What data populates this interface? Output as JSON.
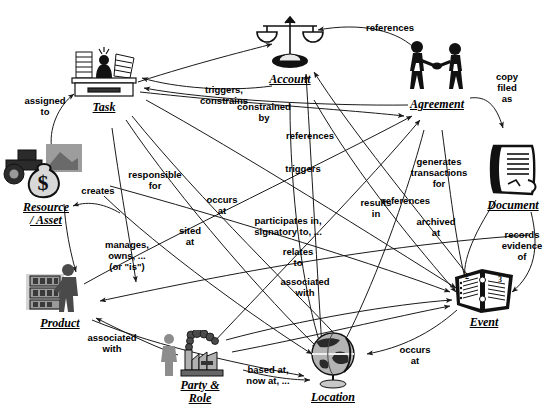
{
  "diagram": {
    "background_color": "#ffffff",
    "line_color": "#1a1a1a",
    "text_color": "#000000",
    "nodes": [
      {
        "id": "task",
        "label": "Task",
        "icon": "desk-paperwork-icon",
        "x": 104,
        "y": 75,
        "w": 76,
        "h": 52,
        "cap_x": 104,
        "cap_y": 113
      },
      {
        "id": "account",
        "label": "Account",
        "icon": "balance-scales-icon",
        "x": 290,
        "y": 45,
        "w": 74,
        "h": 56,
        "cap_x": 290,
        "cap_y": 81
      },
      {
        "id": "agreement",
        "label": "Agreement",
        "icon": "handshake-figures-icon",
        "x": 437,
        "y": 68,
        "w": 74,
        "h": 56,
        "cap_x": 437,
        "cap_y": 122
      },
      {
        "id": "document",
        "label": "Document",
        "icon": "document-sheet-icon",
        "x": 513,
        "y": 170,
        "w": 62,
        "h": 58,
        "cap_x": 513,
        "cap_y": 202
      },
      {
        "id": "event",
        "label": "Event",
        "icon": "open-ledger-book-icon",
        "x": 484,
        "y": 290,
        "w": 66,
        "h": 52,
        "cap_x": 484,
        "cap_y": 325
      },
      {
        "id": "location",
        "label": "Location",
        "icon": "globe-stand-icon",
        "x": 333,
        "y": 360,
        "w": 62,
        "h": 62,
        "cap_x": 333,
        "cap_y": 401
      },
      {
        "id": "party",
        "label": "Party &\nRole",
        "icon": "person-factory-icon",
        "x": 200,
        "y": 355,
        "w": 90,
        "h": 48,
        "cap_x": 200,
        "cap_y": 385
      },
      {
        "id": "product",
        "label": "Product",
        "icon": "person-shelf-display-icon",
        "x": 60,
        "y": 288,
        "w": 72,
        "h": 56,
        "cap_x": 60,
        "cap_y": 323
      },
      {
        "id": "resource",
        "label": "Resource\n/ Asset",
        "icon": "tractor-moneybag-icon",
        "x": 46,
        "y": 172,
        "w": 92,
        "h": 58,
        "cap_x": 46,
        "cap_y": 212
      }
    ],
    "edge_labels": [
      {
        "id": "assigned-to",
        "text": "assigned\nto",
        "x": 45,
        "y": 106
      },
      {
        "id": "creates",
        "text": "creates",
        "x": 98,
        "y": 190
      },
      {
        "id": "triggers-constrains",
        "text": "triggers,\nconstrains",
        "x": 224,
        "y": 95
      },
      {
        "id": "constrained-by",
        "text": "constrained\nby",
        "x": 264,
        "y": 112
      },
      {
        "id": "references-account",
        "text": "references",
        "x": 390,
        "y": 27
      },
      {
        "id": "references-mid",
        "text": "references",
        "x": 310,
        "y": 135
      },
      {
        "id": "triggers",
        "text": "triggers",
        "x": 303,
        "y": 168
      },
      {
        "id": "copy-filed-as",
        "text": "copy\nfiled\nas",
        "x": 507,
        "y": 87
      },
      {
        "id": "responsible-for",
        "text": "responsible\nfor",
        "x": 155,
        "y": 180
      },
      {
        "id": "manages-owns-is",
        "text": "manages,\nowns, ...\n(or \"is\")",
        "x": 127,
        "y": 255
      },
      {
        "id": "sited-at",
        "text": "sited\nat",
        "x": 190,
        "y": 236
      },
      {
        "id": "occurs-at-1",
        "text": "occurs\nat",
        "x": 222,
        "y": 205
      },
      {
        "id": "participates-in",
        "text": "participates in,\nsignatory to, ...",
        "x": 288,
        "y": 226
      },
      {
        "id": "results-in",
        "text": "results\nin",
        "x": 376,
        "y": 208
      },
      {
        "id": "generates-trans",
        "text": "generates\ntransactions\nfor",
        "x": 439,
        "y": 172
      },
      {
        "id": "references-bottom",
        "text": "references",
        "x": 406,
        "y": 200
      },
      {
        "id": "archived-at",
        "text": "archived\nat",
        "x": 436,
        "y": 227
      },
      {
        "id": "records-evidence",
        "text": "records\nevidence\nof",
        "x": 522,
        "y": 245
      },
      {
        "id": "relates-to",
        "text": "relates\nto",
        "x": 298,
        "y": 257
      },
      {
        "id": "associated-with-1",
        "text": "associated\nwith",
        "x": 305,
        "y": 287
      },
      {
        "id": "associated-with-2",
        "text": "associated\nwith",
        "x": 112,
        "y": 343
      },
      {
        "id": "based-at-now-at",
        "text": "based at,\nnow at, ...",
        "x": 268,
        "y": 375
      },
      {
        "id": "occurs-at-2",
        "text": "occurs\nat",
        "x": 415,
        "y": 355
      }
    ]
  }
}
